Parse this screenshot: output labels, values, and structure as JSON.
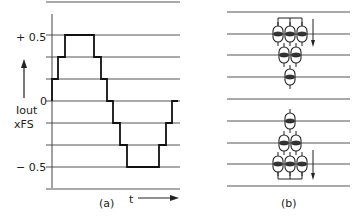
{
  "panel_a": {
    "caption": "(a)",
    "y_axis_label_line1": "Iout",
    "y_axis_label_line2": "xFS",
    "x_axis_label": "t",
    "tick_labels": {
      "plus_half": "+ 0.5",
      "zero": "0",
      "minus_half": "− 0.5"
    },
    "levels": [
      0.75,
      0.5,
      0.333,
      0.167,
      0,
      -0.167,
      -0.333,
      -0.5,
      -0.667
    ],
    "staircase_levels": [
      0,
      0.167,
      0.333,
      0.5,
      0.333,
      0.167,
      0,
      -0.167,
      -0.333,
      -0.5,
      -0.333,
      -0.167,
      0
    ]
  },
  "panel_b": {
    "caption": "(b)",
    "top_group": {
      "rows": [
        3,
        2,
        1
      ],
      "direction": "down"
    },
    "bottom_group": {
      "rows": [
        1,
        2,
        3
      ],
      "direction": "down"
    }
  }
}
